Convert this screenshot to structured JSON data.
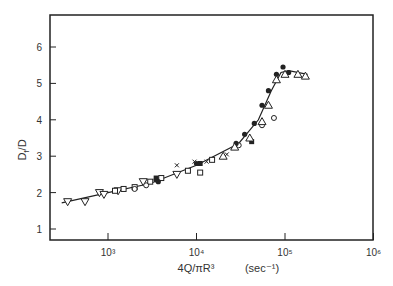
{
  "chart_data": {
    "type": "scatter",
    "title": "",
    "xlabel": "4Q/πR³",
    "xlabel_units": "(sec⁻¹)",
    "ylabel": "D_f/D",
    "xscale": "log",
    "xlim": [
      200,
      1000000
    ],
    "ylim": [
      0.7,
      6.9
    ],
    "x_ticks": [
      1000,
      10000,
      100000,
      1000000
    ],
    "x_tick_labels": [
      "10³",
      "10⁴",
      "10⁵",
      "10⁶"
    ],
    "y_ticks": [
      1,
      2,
      3,
      4,
      5,
      6
    ],
    "y_tick_labels": [
      "1",
      "2",
      "3",
      "4",
      "5",
      "6"
    ],
    "grid": false,
    "legend": null,
    "series": [
      {
        "name": "open triangles down",
        "marker": "triangle-down",
        "points": [
          [
            350,
            1.75
          ],
          [
            550,
            1.75
          ],
          [
            800,
            2.0
          ],
          [
            900,
            1.95
          ],
          [
            1300,
            2.05
          ],
          [
            2500,
            2.3
          ],
          [
            6000,
            2.5
          ]
        ]
      },
      {
        "name": "open squares",
        "marker": "square",
        "points": [
          [
            1200,
            2.05
          ],
          [
            1500,
            2.1
          ],
          [
            2000,
            2.15
          ],
          [
            3000,
            2.3
          ],
          [
            4000,
            2.4
          ],
          [
            8000,
            2.6
          ],
          [
            11000,
            2.55
          ],
          [
            15000,
            2.9
          ]
        ]
      },
      {
        "name": "open circles",
        "marker": "circle",
        "points": [
          [
            2000,
            2.1
          ],
          [
            2700,
            2.2
          ],
          [
            30000,
            3.3
          ],
          [
            55000,
            3.85
          ],
          [
            75000,
            4.05
          ]
        ]
      },
      {
        "name": "filled circles",
        "marker": "circle-filled",
        "points": [
          [
            3500,
            2.35
          ],
          [
            3700,
            2.3
          ],
          [
            10000,
            2.8
          ],
          [
            28000,
            3.35
          ],
          [
            35000,
            3.6
          ],
          [
            45000,
            3.9
          ],
          [
            55000,
            4.4
          ],
          [
            65000,
            4.8
          ],
          [
            80000,
            5.25
          ],
          [
            95000,
            5.45
          ],
          [
            110000,
            5.3
          ]
        ]
      },
      {
        "name": "filled squares",
        "marker": "square-filled",
        "points": [
          [
            3500,
            2.4
          ],
          [
            11000,
            2.8
          ],
          [
            42000,
            3.4
          ]
        ]
      },
      {
        "name": "crosses",
        "marker": "x",
        "points": [
          [
            6000,
            2.75
          ],
          [
            9500,
            2.85
          ],
          [
            13000,
            2.85
          ],
          [
            22000,
            3.05
          ]
        ]
      },
      {
        "name": "open triangles up",
        "marker": "triangle-up",
        "points": [
          [
            20000,
            3.0
          ],
          [
            27000,
            3.25
          ],
          [
            40000,
            3.5
          ],
          [
            55000,
            3.95
          ],
          [
            65000,
            4.4
          ],
          [
            80000,
            5.1
          ],
          [
            100000,
            5.25
          ],
          [
            140000,
            5.25
          ],
          [
            170000,
            5.2
          ]
        ]
      }
    ],
    "fit_curve": [
      [
        300,
        1.72
      ],
      [
        1000,
        2.0
      ],
      [
        3000,
        2.25
      ],
      [
        10000,
        2.75
      ],
      [
        30000,
        3.35
      ],
      [
        50000,
        4.0
      ],
      [
        70000,
        4.8
      ],
      [
        90000,
        5.3
      ],
      [
        110000,
        5.35
      ],
      [
        180000,
        5.25
      ]
    ]
  },
  "axes": {
    "x_title": "4Q/πR³",
    "x_units": "(sec⁻¹)",
    "y_title_main": "D",
    "y_title_sub": "f",
    "y_title_tail": "/D"
  }
}
